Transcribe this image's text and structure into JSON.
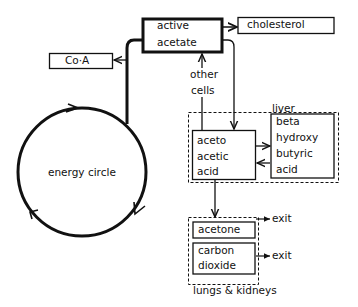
{
  "nodes": {
    "active_acetate": {
      "line1": "active",
      "line2": "acetate"
    },
    "cholesterol": "cholesterol",
    "coa": "Co·A",
    "other_cells": {
      "line1": "other",
      "line2": "cells"
    },
    "energy_circle": "energy circle",
    "aceto_acetic_acid": {
      "line1": "aceto",
      "line2": "acetic",
      "line3": "acid"
    },
    "beta_hydroxy_butyric_acid": {
      "line1": "beta",
      "line2": "hydroxy",
      "line3": "butyric",
      "line4": "acid"
    },
    "acetone": "acetone",
    "carbon_dioxide": {
      "line1": "carbon",
      "line2": "dioxide"
    }
  },
  "groups": {
    "liver": "liver",
    "lungs_kidneys": "lungs & kidneys"
  },
  "exits": {
    "acetone_exit": "exit",
    "co2_exit": "exit"
  },
  "colors": {
    "ink": "#111111",
    "background": "#ffffff"
  }
}
